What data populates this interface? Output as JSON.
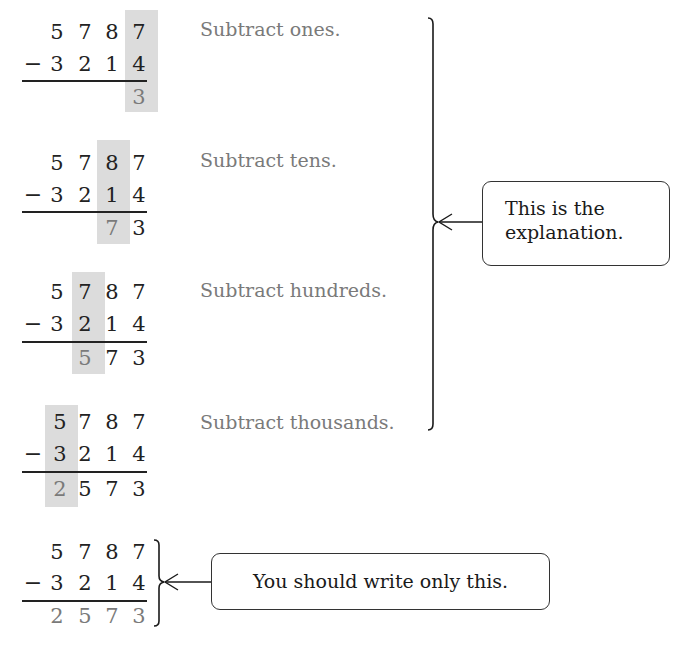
{
  "problem": {
    "minuend": [
      "5",
      "7",
      "8",
      "7"
    ],
    "subtrahend": [
      "3",
      "2",
      "1",
      "4"
    ],
    "operator": "−",
    "answer": [
      "2",
      "5",
      "7",
      "3"
    ]
  },
  "steps": [
    {
      "label": "Subtract ones.",
      "shaded_column": 3,
      "result": [
        "",
        "",
        "",
        "3"
      ]
    },
    {
      "label": "Subtract tens.",
      "shaded_column": 2,
      "result": [
        "",
        "",
        "7",
        "3"
      ]
    },
    {
      "label": "Subtract hundreds.",
      "shaded_column": 1,
      "result": [
        "",
        "5",
        "7",
        "3"
      ]
    },
    {
      "label": "Subtract thousands.",
      "shaded_column": 0,
      "result": [
        "2",
        "5",
        "7",
        "3"
      ]
    }
  ],
  "callouts": {
    "explanation": {
      "line1": "This is the",
      "line2": "explanation."
    },
    "final": "You should write only this."
  },
  "colors": {
    "shade": "#dcdcdc",
    "result_text": "#7a7a7a",
    "ink": "#222222"
  }
}
